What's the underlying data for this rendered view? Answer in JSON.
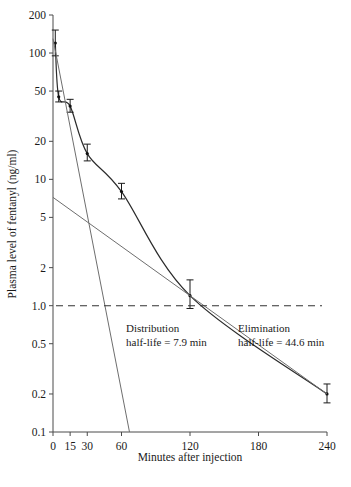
{
  "chart_data": {
    "type": "line",
    "title": "",
    "xlabel": "Minutes after injection",
    "ylabel": "Plasma level of fentanyl (ng/ml)",
    "yscale": "log",
    "ylim": [
      0.1,
      200
    ],
    "xlim": [
      0,
      240
    ],
    "grid": false,
    "legend": "none",
    "yticks": [
      "200",
      "100",
      "50",
      "20",
      "10",
      "5",
      "2",
      "1.0",
      "0.5",
      "0.2",
      "0.1"
    ],
    "ytick_values": [
      200,
      100,
      50,
      20,
      10,
      5,
      2,
      1.0,
      0.5,
      0.2,
      0.1
    ],
    "xticks": [
      "0",
      "15",
      "30",
      "60",
      "120",
      "180",
      "240"
    ],
    "xtick_values": [
      0,
      15,
      30,
      60,
      120,
      180,
      240
    ],
    "series": [
      {
        "name": "Observed plasma fentanyl",
        "style": "points-with-error-bars-and-curve",
        "x": [
          2,
          5,
          15,
          30,
          60,
          120,
          240
        ],
        "y": [
          120,
          45,
          38,
          16,
          8.0,
          1.2,
          0.2
        ],
        "yerr_low": [
          95,
          41,
          34,
          14,
          7.0,
          0.95,
          0.17
        ],
        "yerr_high": [
          152,
          50,
          43,
          19,
          9.3,
          1.6,
          0.24
        ]
      },
      {
        "name": "Distribution phase line",
        "style": "straight-line",
        "x": [
          0,
          67
        ],
        "y": [
          130,
          0.1
        ]
      },
      {
        "name": "Elimination phase line",
        "style": "straight-line",
        "x": [
          0,
          240
        ],
        "y": [
          7.2,
          0.2
        ]
      },
      {
        "name": "Reference level 1.0 ng/ml",
        "style": "dashed-horizontal",
        "y": 1.0
      }
    ],
    "annotations": [
      {
        "id": "distribution",
        "line1": "Distribution",
        "line2": "half-life = 7.9 min",
        "value": 7.9,
        "unit": "min"
      },
      {
        "id": "elimination",
        "line1": "Elimination",
        "line2": "half-life = 44.6 min",
        "value": 44.6,
        "unit": "min"
      }
    ]
  }
}
